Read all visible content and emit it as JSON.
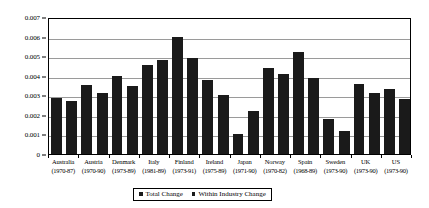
{
  "chart_data": {
    "type": "bar",
    "title": "",
    "xlabel": "",
    "ylabel": "",
    "ylim": [
      0,
      0.007
    ],
    "ytick_values": [
      0,
      0.001,
      0.002,
      0.003,
      0.004,
      0.005,
      0.006,
      0.007
    ],
    "ytick_labels": [
      "0",
      "0.001",
      "0.002",
      "0.003",
      "0.004",
      "0.005",
      "0.006",
      "0.007"
    ],
    "grid": true,
    "legend_position": "bottom-center",
    "categories": [
      "Australia",
      "Austria",
      "Denmark",
      "Italy",
      "Finland",
      "Ireland",
      "Japan",
      "Norway",
      "Spain",
      "Sweden",
      "UK",
      "US"
    ],
    "category_periods": [
      "(1970-87)",
      "(1970-90)",
      "(1973-89)",
      "(1981-89)",
      "(1973-91)",
      "(1975-89)",
      "(1971-90)",
      "(1970-82)",
      "(1968-89)",
      "(1973-90)",
      "(1973-90)",
      "(1973-90)"
    ],
    "series": [
      {
        "name": "Total Change",
        "color": "#1a1a1a",
        "values": [
          0.00285,
          0.00355,
          0.004,
          0.00455,
          0.006,
          0.0038,
          0.001,
          0.0044,
          0.0052,
          0.0018,
          0.0036,
          0.0033
        ]
      },
      {
        "name": "Within Industry Change",
        "color": "#1a1a1a",
        "values": [
          0.0027,
          0.0031,
          0.0035,
          0.00478,
          0.0049,
          0.003,
          0.0022,
          0.0041,
          0.0039,
          0.0012,
          0.0031,
          0.0028
        ]
      }
    ]
  },
  "legend": {
    "entries": [
      {
        "label": "Total Change"
      },
      {
        "label": "Within Industry Change"
      }
    ]
  }
}
